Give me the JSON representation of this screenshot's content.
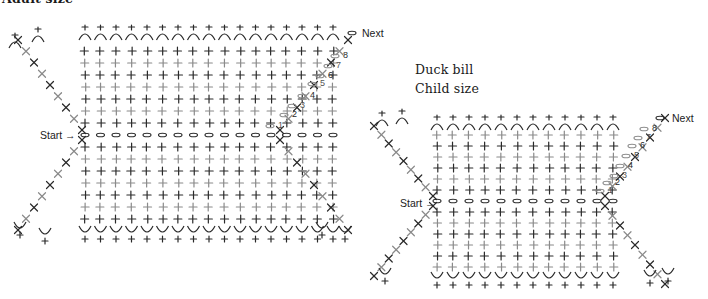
{
  "adult": {
    "title": "Adult size",
    "start_label": "Start",
    "next_label": "Next",
    "row_numbers": [
      "1",
      "2",
      "3",
      "4",
      "5",
      "6",
      "7",
      "8"
    ]
  },
  "child": {
    "title_line1": "Duck bill",
    "title_line2": "Child size",
    "start_label": "Start",
    "next_label": "Next",
    "row_numbers": [
      "1",
      "2",
      "3",
      "4",
      "5",
      "6",
      "7",
      "8"
    ]
  },
  "colors": {
    "dark_stitch": "#2a2a2a",
    "light_stitch": "#8a8a8a",
    "background": "#ffffff"
  },
  "legend_symbols": {
    "single_crochet": "+",
    "increase": "V",
    "decrease": "X",
    "chain": "oval"
  }
}
